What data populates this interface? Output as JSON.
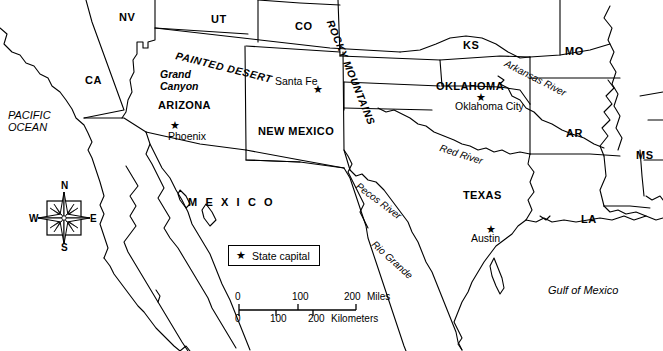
{
  "map": {
    "title": "Southwestern United States and Northern Mexico",
    "stroke_color": "#000000",
    "background_color": "#ffffff",
    "width": 663,
    "height": 351
  },
  "state_abbreviations": [
    {
      "label": "NV",
      "x": 119,
      "y": 12
    },
    {
      "label": "UT",
      "x": 211,
      "y": 14
    },
    {
      "label": "CO",
      "x": 295,
      "y": 21
    },
    {
      "label": "KS",
      "x": 463,
      "y": 40
    },
    {
      "label": "MO",
      "x": 565,
      "y": 46
    },
    {
      "label": "CA",
      "x": 85,
      "y": 75
    },
    {
      "label": "AR",
      "x": 566,
      "y": 128
    },
    {
      "label": "MS",
      "x": 636,
      "y": 150
    },
    {
      "label": "LA",
      "x": 581,
      "y": 214
    }
  ],
  "state_names": [
    {
      "label": "ARIZONA",
      "x": 158,
      "y": 100
    },
    {
      "label": "NEW MEXICO",
      "x": 258,
      "y": 126
    },
    {
      "label": "OKLAHOMA",
      "x": 436,
      "y": 81
    },
    {
      "label": "TEXAS",
      "x": 463,
      "y": 190
    }
  ],
  "country_names": [
    {
      "label": "M E X I C O",
      "x": 188,
      "y": 197
    }
  ],
  "cities": [
    {
      "label": "Santa Fe",
      "star_x": 313,
      "star_y": 84,
      "text_x": 275,
      "text_y": 76
    },
    {
      "label": "Phoenix",
      "star_x": 170,
      "star_y": 120,
      "text_x": 168,
      "text_y": 131
    },
    {
      "label": "Oklahoma City",
      "star_x": 476,
      "star_y": 92,
      "text_x": 455,
      "text_y": 101
    },
    {
      "label": "Austin",
      "star_x": 486,
      "star_y": 224,
      "text_x": 471,
      "text_y": 233
    }
  ],
  "water_features": [
    {
      "label": "PACIFIC",
      "x": 8,
      "y": 110,
      "style": "water"
    },
    {
      "label": "OCEAN",
      "x": 8,
      "y": 122,
      "style": "water"
    },
    {
      "label": "Gulf of Mexico",
      "x": 548,
      "y": 285,
      "style": "water"
    }
  ],
  "physical_features": [
    {
      "label": "Grand",
      "x": 160,
      "y": 69,
      "rotation": 0
    },
    {
      "label": "Canyon",
      "x": 160,
      "y": 81,
      "rotation": 0
    },
    {
      "label": "PAINTED DESERT",
      "x": 176,
      "y": 50,
      "rotation": 14
    },
    {
      "label": "ROCKY MOUNTAINS",
      "x": 330,
      "y": 15,
      "rotation": 68
    }
  ],
  "rivers": [
    {
      "label": "Arkansas River",
      "x": 505,
      "y": 58,
      "rotation": 27
    },
    {
      "label": "Red River",
      "x": 440,
      "y": 143,
      "rotation": 18
    },
    {
      "label": "Pecos River",
      "x": 357,
      "y": 180,
      "rotation": 37
    },
    {
      "label": "Rio Grande",
      "x": 373,
      "y": 238,
      "rotation": 42
    }
  ],
  "legend": {
    "star_symbol": "★",
    "label": "State capital"
  },
  "compass": {
    "north": "N",
    "south": "S",
    "east": "E",
    "west": "W"
  },
  "scale_bar": {
    "miles_ticks": [
      "0",
      "100",
      "200"
    ],
    "miles_unit": "Miles",
    "kilometers_ticks": [
      "0",
      "100",
      "200"
    ],
    "kilometers_unit": "Kilometers"
  }
}
